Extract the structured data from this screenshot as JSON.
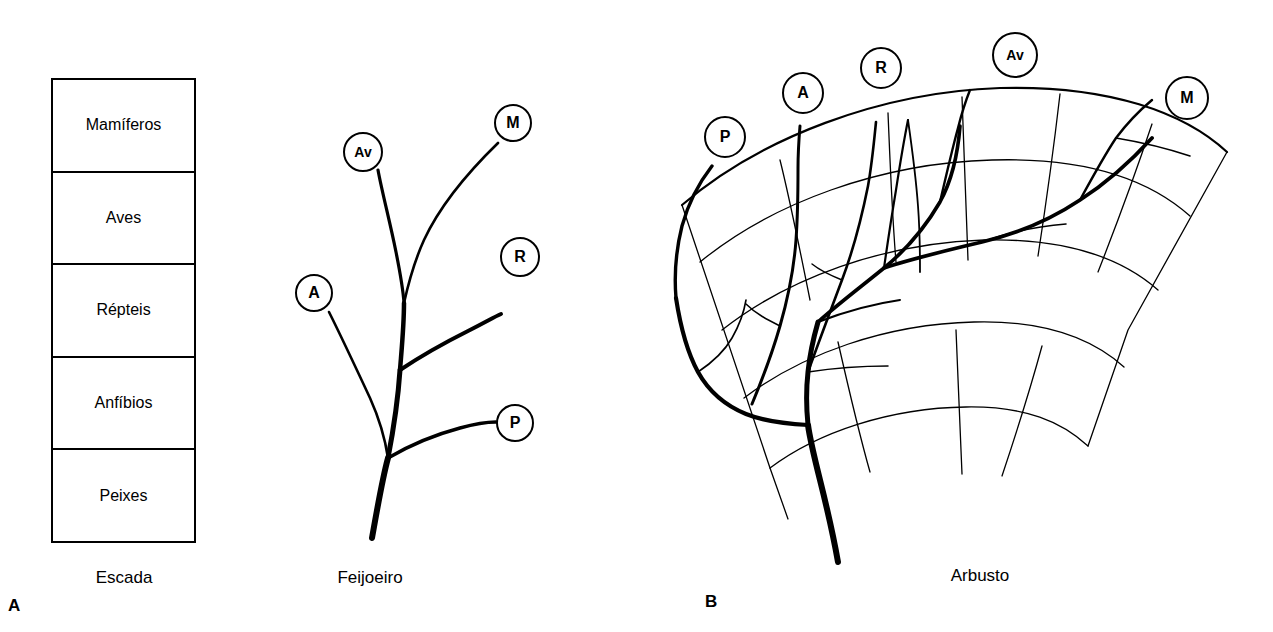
{
  "figure": {
    "background_color": "#ffffff",
    "ink_color": "#000000"
  },
  "panels": [
    {
      "letter": "A",
      "sub_figures": [
        {
          "caption": "Escada",
          "type": "ladder",
          "rows": [
            {
              "label": "Mamíferos"
            },
            {
              "label": "Aves"
            },
            {
              "label": "Répteis"
            },
            {
              "label": "Anfíbios"
            },
            {
              "label": "Peixes"
            }
          ]
        },
        {
          "caption": "Feijoeiro",
          "type": "tree",
          "nodes": [
            {
              "code": "M",
              "full": "Mamíferos",
              "x": 513,
              "y": 123,
              "r": 19
            },
            {
              "code": "Av",
              "full": "Aves",
              "x": 363,
              "y": 152,
              "r": 20
            },
            {
              "code": "R",
              "full": "Répteis",
              "x": 520,
              "y": 257,
              "r": 20
            },
            {
              "code": "A",
              "full": "Anfíbios",
              "x": 314,
              "y": 293,
              "r": 19
            },
            {
              "code": "P",
              "full": "Peixes",
              "x": 515,
              "y": 423,
              "r": 19
            }
          ]
        }
      ]
    },
    {
      "letter": "B",
      "sub_figures": [
        {
          "caption": "Arbusto",
          "type": "fan-bush",
          "nodes": [
            {
              "code": "P",
              "full": "Peixes",
              "x": 725,
              "y": 137,
              "r": 21
            },
            {
              "code": "A",
              "full": "Anfíbios",
              "x": 803,
              "y": 93,
              "r": 21
            },
            {
              "code": "R",
              "full": "Répteis",
              "x": 881,
              "y": 68,
              "r": 21
            },
            {
              "code": "Av",
              "full": "Aves",
              "x": 1015,
              "y": 55,
              "r": 23
            },
            {
              "code": "M",
              "full": "Mamíferos",
              "x": 1187,
              "y": 98,
              "r": 22
            }
          ]
        }
      ]
    }
  ]
}
